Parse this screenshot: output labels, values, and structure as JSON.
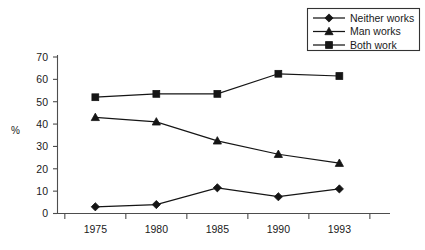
{
  "chart_data": {
    "type": "line",
    "title": "",
    "xlabel": "",
    "ylabel": "%",
    "categories": [
      "1975",
      "1980",
      "1985",
      "1990",
      "1993"
    ],
    "ylim": [
      0,
      70
    ],
    "ytick_step": 10,
    "yticks": [
      "0",
      "10",
      "20",
      "30",
      "40",
      "50",
      "60",
      "70"
    ],
    "grid": false,
    "legend_position": "top-right",
    "series": [
      {
        "name": "Neither works",
        "marker": "diamond",
        "color": "#151515",
        "values": [
          3,
          4,
          11.5,
          7.5,
          11
        ]
      },
      {
        "name": "Man works",
        "marker": "triangle",
        "color": "#151515",
        "values": [
          43,
          41,
          32.5,
          26.5,
          22.5
        ]
      },
      {
        "name": "Both work",
        "marker": "square",
        "color": "#151515",
        "values": [
          52,
          53.5,
          53.5,
          62.5,
          61.5
        ]
      }
    ]
  },
  "axis": {
    "y_label": "%",
    "y_ticks": [
      "70",
      "60",
      "50",
      "40",
      "30",
      "20",
      "10",
      "0"
    ],
    "x_ticks": [
      "1975",
      "1980",
      "1985",
      "1990",
      "1993"
    ]
  },
  "legend": {
    "items": [
      {
        "label": "Neither works",
        "marker": "diamond"
      },
      {
        "label": "Man works",
        "marker": "triangle"
      },
      {
        "label": "Both work",
        "marker": "square"
      }
    ]
  },
  "colors": {
    "ink": "#151515",
    "axis": "#4d4d4d",
    "background": "#ffffff"
  }
}
